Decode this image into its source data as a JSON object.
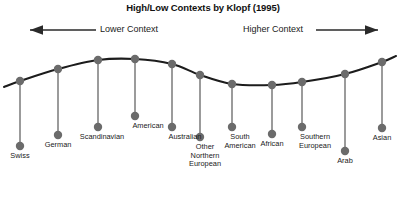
{
  "chart_data": {
    "type": "line",
    "title": "High/Low Contexts by Klopf (1995)",
    "xlabel": "",
    "ylabel": "",
    "axis_annotations": [
      {
        "text": "Lower Context",
        "arrow": "left",
        "side": "left"
      },
      {
        "text": "Higher Context",
        "arrow": "right",
        "side": "right"
      }
    ],
    "categories": [
      "Swiss",
      "German",
      "Scandinavian",
      "American",
      "Australian",
      "Other\nNorthern\nEuropean",
      "South\nAmerican",
      "African",
      "Southern\nEuropean",
      "Arab",
      "Asian"
    ],
    "note": "Context level rises from left (lower context) to right (higher context); curve shows a local peak around American and a trough around African.",
    "points": [
      {
        "label": "Swiss",
        "x": 20,
        "y": 81,
        "label_x": 20,
        "label_y": 152,
        "stem_end": 146
      },
      {
        "label": "German",
        "x": 58,
        "y": 69,
        "label_x": 58,
        "label_y": 141,
        "stem_end": 135
      },
      {
        "label": "Scandinavian",
        "x": 98,
        "y": 60,
        "label_x": 102,
        "label_y": 133,
        "stem_end": 127
      },
      {
        "label": "American",
        "x": 135,
        "y": 59,
        "label_x": 148,
        "label_y": 122,
        "stem_end": 116
      },
      {
        "label": "Australian",
        "x": 172,
        "y": 64,
        "label_x": 185,
        "label_y": 133,
        "stem_end": 127
      },
      {
        "label": "Other\nNorthern\nEuropean",
        "x": 200,
        "y": 75,
        "label_x": 205,
        "label_y": 143,
        "stem_end": 137
      },
      {
        "label": "South\nAmerican",
        "x": 232,
        "y": 84,
        "label_x": 240,
        "label_y": 133,
        "stem_end": 127
      },
      {
        "label": "African",
        "x": 272,
        "y": 85,
        "label_x": 272,
        "label_y": 140,
        "stem_end": 134
      },
      {
        "label": "Southern\nEuropean",
        "x": 302,
        "y": 82,
        "label_x": 315,
        "label_y": 133,
        "stem_end": 127
      },
      {
        "label": "Arab",
        "x": 345,
        "y": 74,
        "label_x": 345,
        "label_y": 157,
        "stem_end": 151
      },
      {
        "label": "Asian",
        "x": 382,
        "y": 62,
        "label_x": 382,
        "label_y": 134,
        "stem_end": 128
      }
    ],
    "style": {
      "curve_color": "#1c1c1c",
      "marker_color": "#6b6b6b",
      "stem_color": "#7a7a7a",
      "background": "#ffffff",
      "grid": false,
      "legend": false
    }
  }
}
